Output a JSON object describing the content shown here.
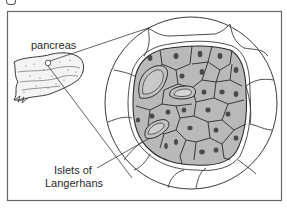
{
  "figure": {
    "labels": {
      "pancreas": "pancreas",
      "islets_line1": "Islets of",
      "islets_line2": "Langerhans"
    },
    "colors": {
      "line": "#3a3a3a",
      "cell_fill": "#b9b9b9",
      "nucleus": "#4a4a4a",
      "frame": "#666666",
      "background": "#ffffff"
    }
  }
}
